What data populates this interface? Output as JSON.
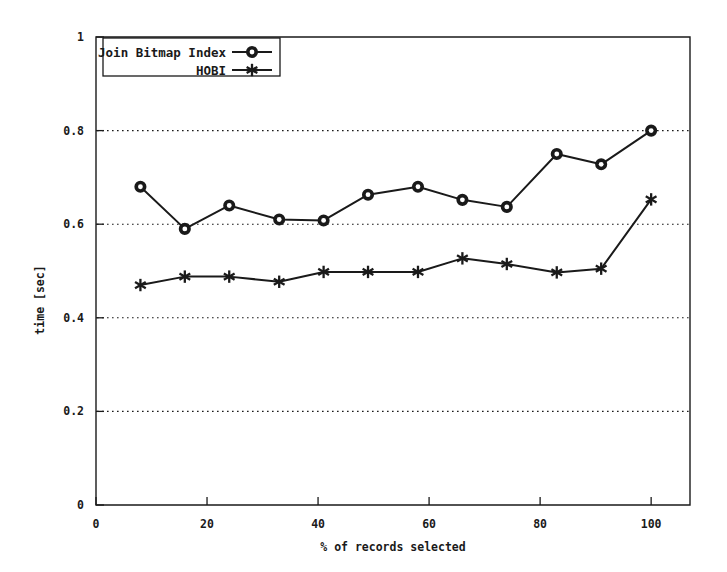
{
  "chart_data": {
    "type": "line",
    "title": "",
    "xlabel": "% of records selected",
    "ylabel": "time [sec]",
    "xlim": [
      0,
      107
    ],
    "ylim": [
      0,
      1
    ],
    "xticks": [
      "0",
      "20",
      "40",
      "60",
      "80",
      "100"
    ],
    "xtick_values": [
      0,
      20,
      40,
      60,
      80,
      100
    ],
    "yticks": [
      "0",
      "0.2",
      "0.4",
      "0.6",
      "0.8",
      "1"
    ],
    "ytick_values": [
      0,
      0.2,
      0.4,
      0.6,
      0.8,
      1
    ],
    "grid": "horizontal-dotted",
    "gridline_values": [
      0.2,
      0.4,
      0.6,
      0.8
    ],
    "legend_position": "top-left-inside",
    "series": [
      {
        "name": "Join Bitmap Index",
        "marker": "circle",
        "x": [
          8,
          16,
          24,
          33,
          41,
          49,
          58,
          66,
          74,
          83,
          91,
          100
        ],
        "values": [
          0.68,
          0.59,
          0.64,
          0.61,
          0.608,
          0.663,
          0.68,
          0.652,
          0.637,
          0.75,
          0.728,
          0.8
        ]
      },
      {
        "name": "HOBI",
        "marker": "star",
        "x": [
          8,
          16,
          24,
          33,
          41,
          49,
          58,
          66,
          74,
          83,
          91,
          100
        ],
        "values": [
          0.47,
          0.488,
          0.488,
          0.477,
          0.498,
          0.498,
          0.498,
          0.527,
          0.515,
          0.497,
          0.505,
          0.653
        ]
      }
    ]
  },
  "legend": {
    "entries": [
      {
        "label": "Join Bitmap Index",
        "marker": "circle"
      },
      {
        "label": "HOBI",
        "marker": "star"
      }
    ]
  },
  "colors": {
    "ink": "#1a1a1a",
    "background": "#ffffff"
  }
}
